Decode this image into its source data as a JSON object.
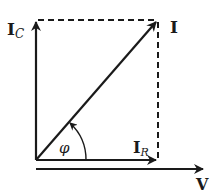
{
  "diagram": {
    "type": "phasor-diagram",
    "colors": {
      "stroke": "#1a1a1a",
      "background": "#ffffff"
    },
    "labels": {
      "ic_main": "I",
      "ic_sub": "C",
      "i": "I",
      "ir_main": "I",
      "ir_sub": "R",
      "v": "V",
      "phi": "φ"
    },
    "vectors": [
      {
        "name": "I_C",
        "from": [
          36,
          160
        ],
        "to": [
          36,
          20
        ]
      },
      {
        "name": "I",
        "from": [
          36,
          160
        ],
        "to": [
          158,
          20
        ]
      },
      {
        "name": "I_R",
        "from": [
          36,
          160
        ],
        "to": [
          158,
          160
        ]
      },
      {
        "name": "V",
        "from": [
          36,
          168
        ],
        "to": [
          205,
          168
        ]
      }
    ],
    "dashed_lines": [
      {
        "from": [
          36,
          20
        ],
        "to": [
          158,
          20
        ]
      },
      {
        "from": [
          158,
          20
        ],
        "to": [
          158,
          160
        ]
      }
    ],
    "angle": {
      "label": "φ",
      "between": [
        "I_R",
        "I"
      ]
    }
  }
}
